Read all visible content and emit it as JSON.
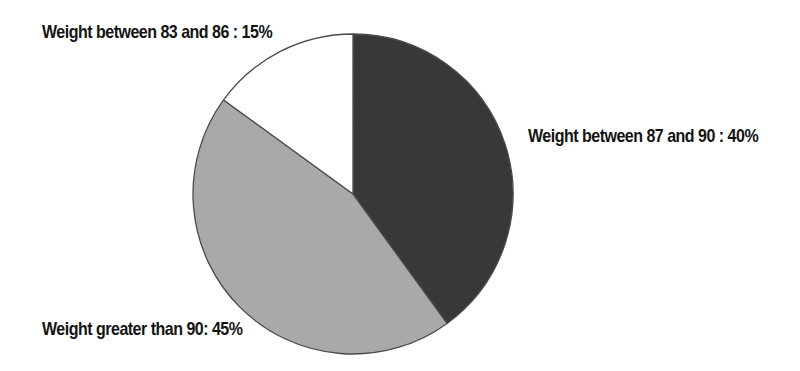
{
  "figure": {
    "background": "#ffffff",
    "text_color": "#141414"
  },
  "chart_data": {
    "type": "pie",
    "title": "",
    "start_angle_deg": -90,
    "direction": "clockwise",
    "outline_color": "#4a4a4a",
    "legend_position": "labels-adjacent-to-slices",
    "slices": [
      {
        "name": "weight-between-87-and-90",
        "label": "Weight between 87 and 90",
        "value_pct": 40,
        "color": "#383838",
        "annotation": "Weight between 87 and 90 : 40%"
      },
      {
        "name": "weight-greater-than-90",
        "label": "Weight greater than 90",
        "value_pct": 45,
        "color": "#a9a9a9",
        "annotation": "Weight greater than 90: 45%"
      },
      {
        "name": "weight-between-83-and-86",
        "label": "Weight between 83 and 86",
        "value_pct": 15,
        "color": "#ffffff",
        "annotation": "Weight between 83 and 86 : 15%"
      }
    ]
  }
}
